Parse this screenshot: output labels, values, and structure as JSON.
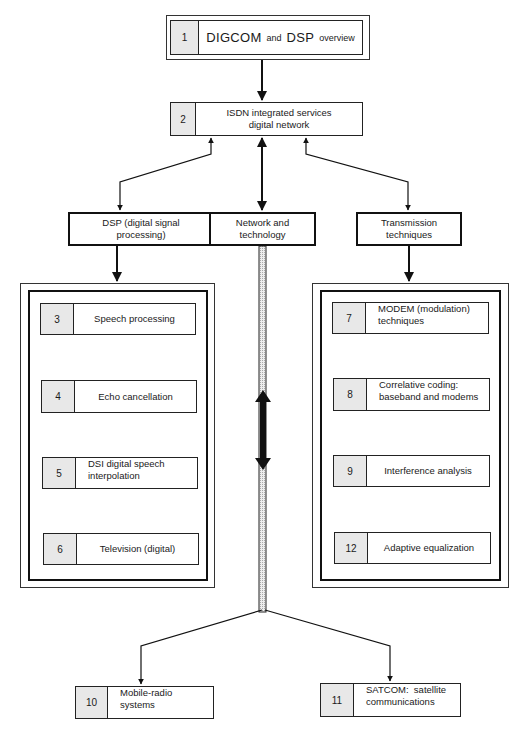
{
  "diagram": {
    "top": {
      "number": "1",
      "title_part1": "DIGCOM",
      "title_part2": "and",
      "title_part3": "DSP",
      "title_part4": "overview"
    },
    "isdn": {
      "number": "2",
      "line1": "ISDN integrated services",
      "line2": "digital network"
    },
    "branches": {
      "dsp": {
        "line1": "DSP (digital signal",
        "line2": "processing)"
      },
      "network": {
        "line1": "Network and",
        "line2": "technology"
      },
      "transmission": {
        "line1": "Transmission",
        "line2": "techniques"
      }
    },
    "dsp_items": [
      {
        "number": "3",
        "line1": "Speech processing",
        "line2": ""
      },
      {
        "number": "4",
        "line1": "Echo cancellation",
        "line2": ""
      },
      {
        "number": "5",
        "line1": "DSI digital speech",
        "line2": "interpolation"
      },
      {
        "number": "6",
        "line1": "Television (digital)",
        "line2": ""
      }
    ],
    "transmission_items": [
      {
        "number": "7",
        "line1": "MODEM (modulation)",
        "line2": "techniques"
      },
      {
        "number": "8",
        "line1": "Correlative coding:",
        "line2": "baseband and modems"
      },
      {
        "number": "9",
        "line1": "Interference analysis",
        "line2": ""
      },
      {
        "number": "12",
        "line1": "Adaptive equalization",
        "line2": ""
      }
    ],
    "bottom": [
      {
        "number": "10",
        "line1": "Mobile-radio systems",
        "line2": ""
      },
      {
        "number": "11",
        "line1": "SATCOM:  satellite",
        "line2": "communications"
      }
    ]
  }
}
